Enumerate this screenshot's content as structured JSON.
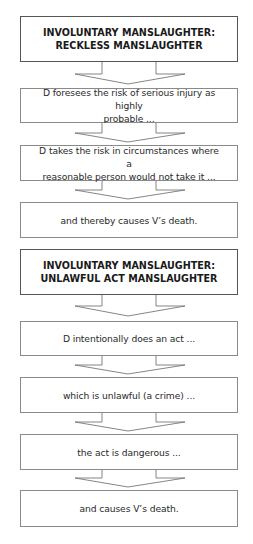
{
  "diagram": {
    "sections": [
      {
        "heading": "INVOLUNTARY MANSLAUGHTER: RECKLESS MANSLAUGHTER",
        "heading_lines": [
          "INVOLUNTARY MANSLAUGHTER:",
          "RECKLESS MANSLAUGHTER"
        ],
        "steps": [
          {
            "lines": [
              "D foresees the risk of serious injury as highly",
              "probable ..."
            ]
          },
          {
            "lines": [
              "D takes the risk in circumstances where a",
              "reasonable person would not take it ..."
            ]
          },
          {
            "lines": [
              "and thereby causes V’s death."
            ]
          }
        ]
      },
      {
        "heading": "INVOLUNTARY MANSLAUGHTER: UNLAWFUL ACT MANSLAUGHTER",
        "heading_lines": [
          "INVOLUNTARY MANSLAUGHTER:",
          "UNLAWFUL ACT MANSLAUGHTER"
        ],
        "steps": [
          {
            "lines": [
              "D intentionally does an act ..."
            ]
          },
          {
            "lines": [
              "which is unlawful (a crime) ..."
            ]
          },
          {
            "lines": [
              "the act is dangerous ..."
            ]
          },
          {
            "lines": [
              "and causes V’s death."
            ]
          }
        ]
      }
    ],
    "colors": {
      "border": "#8a8a8a",
      "heading_border": "#555555",
      "text": "#2a2a2a",
      "arrow": "#777777"
    }
  }
}
